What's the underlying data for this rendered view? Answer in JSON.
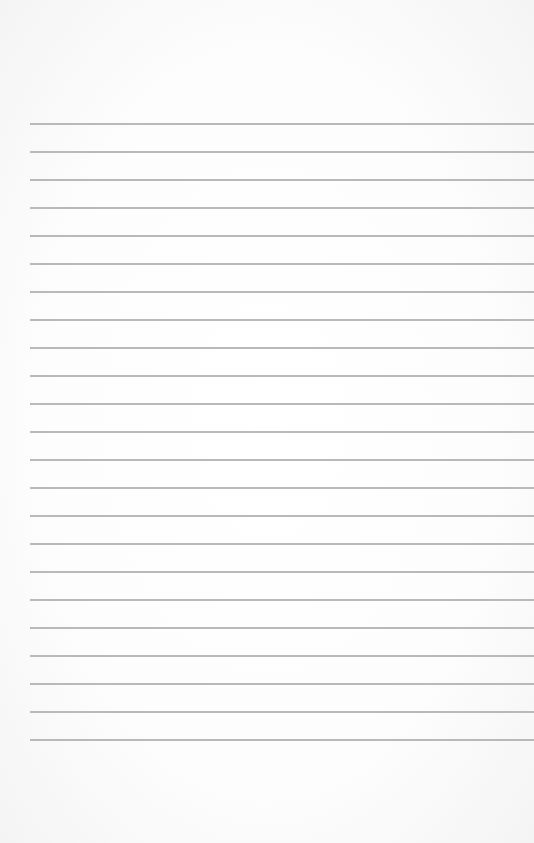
{
  "page": {
    "type": "lined-paper",
    "background_color": "#fdfdfd",
    "rule_color": "#b9b9b9",
    "rule_count": 23,
    "first_rule_y": 123,
    "rule_spacing": 28,
    "rule_left": 30
  }
}
